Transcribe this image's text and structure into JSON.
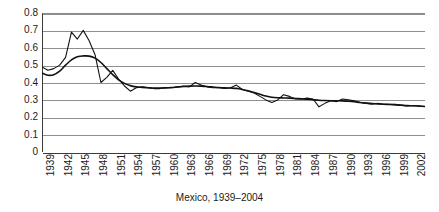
{
  "caption": "Mexico, 1939–2004",
  "chart_data": {
    "type": "line",
    "title": "",
    "subtitle": "",
    "caption": "Mexico, 1939–2004",
    "xlabel": "",
    "ylabel": "",
    "xlim": [
      1939,
      2004
    ],
    "ylim": [
      0,
      0.8
    ],
    "grid": true,
    "legend": "none",
    "y_ticks": [
      "0",
      "0.1",
      "0.2",
      "0.3",
      "0.4",
      "0.5",
      "0.6",
      "0.7",
      "0.8"
    ],
    "y_tick_values": [
      0,
      0.1,
      0.2,
      0.3,
      0.4,
      0.5,
      0.6,
      0.7,
      0.8
    ],
    "x_tick_labels": [
      "1939",
      "1942",
      "1945",
      "1948",
      "1951",
      "1954",
      "1957",
      "1960",
      "1963",
      "1966",
      "1969",
      "1972",
      "1975",
      "1978",
      "1981",
      "1984",
      "1987",
      "1990",
      "1993",
      "1996",
      "1999",
      "2002"
    ],
    "x_tick_values": [
      1939,
      1942,
      1945,
      1948,
      1951,
      1954,
      1957,
      1960,
      1963,
      1966,
      1969,
      1972,
      1975,
      1978,
      1981,
      1984,
      1987,
      1990,
      1993,
      1996,
      1999,
      2002
    ],
    "x": [
      1939,
      1940,
      1941,
      1942,
      1943,
      1944,
      1945,
      1946,
      1947,
      1948,
      1949,
      1950,
      1951,
      1952,
      1953,
      1954,
      1955,
      1956,
      1957,
      1958,
      1959,
      1960,
      1961,
      1962,
      1963,
      1964,
      1965,
      1966,
      1967,
      1968,
      1969,
      1970,
      1971,
      1972,
      1973,
      1974,
      1975,
      1976,
      1977,
      1978,
      1979,
      1980,
      1981,
      1982,
      1983,
      1984,
      1985,
      1986,
      1987,
      1988,
      1989,
      1990,
      1991,
      1992,
      1993,
      1994,
      1995,
      1996,
      1997,
      1998,
      1999,
      2000,
      2001,
      2002,
      2003,
      2004
    ],
    "series": [
      {
        "name": "observed",
        "style": "jagged",
        "values": [
          0.49,
          0.47,
          0.48,
          0.5,
          0.545,
          0.69,
          0.65,
          0.7,
          0.64,
          0.56,
          0.4,
          0.43,
          0.47,
          0.42,
          0.38,
          0.35,
          0.37,
          0.375,
          0.37,
          0.365,
          0.365,
          0.37,
          0.37,
          0.375,
          0.38,
          0.375,
          0.4,
          0.385,
          0.375,
          0.37,
          0.37,
          0.365,
          0.37,
          0.385,
          0.36,
          0.35,
          0.34,
          0.32,
          0.3,
          0.285,
          0.3,
          0.33,
          0.32,
          0.305,
          0.305,
          0.31,
          0.305,
          0.26,
          0.28,
          0.295,
          0.29,
          0.305,
          0.3,
          0.295,
          0.285,
          0.28,
          0.275,
          0.28,
          0.275,
          0.275,
          0.275,
          0.27,
          0.265,
          0.268,
          0.265,
          0.262
        ]
      },
      {
        "name": "smoothed-trend",
        "style": "smooth",
        "values": [
          0.455,
          0.442,
          0.445,
          0.465,
          0.5,
          0.53,
          0.548,
          0.553,
          0.552,
          0.54,
          0.515,
          0.48,
          0.445,
          0.415,
          0.395,
          0.382,
          0.375,
          0.372,
          0.37,
          0.368,
          0.368,
          0.369,
          0.371,
          0.374,
          0.377,
          0.379,
          0.38,
          0.379,
          0.377,
          0.374,
          0.371,
          0.369,
          0.368,
          0.366,
          0.36,
          0.352,
          0.342,
          0.332,
          0.322,
          0.315,
          0.312,
          0.311,
          0.31,
          0.308,
          0.306,
          0.304,
          0.301,
          0.298,
          0.296,
          0.295,
          0.295,
          0.294,
          0.292,
          0.289,
          0.285,
          0.282,
          0.279,
          0.277,
          0.275,
          0.273,
          0.271,
          0.269,
          0.267,
          0.266,
          0.264,
          0.262
        ]
      }
    ]
  }
}
